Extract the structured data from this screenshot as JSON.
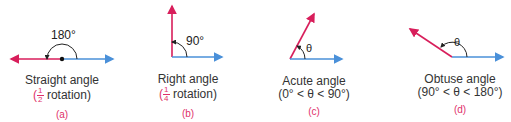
{
  "colors": {
    "initial_side": "#4a90d9",
    "terminal_side": "#d81e5b",
    "arc": "#222222",
    "caption": "#333333",
    "sublabel": "#e0306a"
  },
  "panels": [
    {
      "id": "a",
      "title": "Straight angle",
      "detail_prefix": "(",
      "fraction": {
        "num": "1",
        "den": "2"
      },
      "detail_suffix": " rotation)",
      "angle_label": "180°",
      "sublabel": "(a)"
    },
    {
      "id": "b",
      "title": "Right angle",
      "detail_prefix": "(",
      "fraction": {
        "num": "1",
        "den": "4"
      },
      "detail_suffix": " rotation)",
      "angle_label": "90°",
      "sublabel": "(b)"
    },
    {
      "id": "c",
      "title": "Acute angle",
      "detail": "(0° < θ < 90°)",
      "angle_label": "θ",
      "sublabel": "(c)"
    },
    {
      "id": "d",
      "title": "Obtuse angle",
      "detail": "(90° < θ < 180°)",
      "angle_label": "θ",
      "sublabel": "(d)"
    }
  ]
}
